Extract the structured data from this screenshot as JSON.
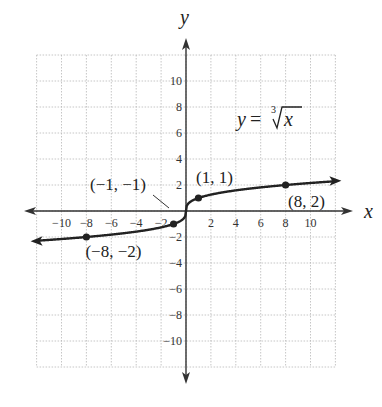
{
  "chart_data": {
    "type": "line",
    "title": "",
    "equation": {
      "lhs": "y",
      "eq": "=",
      "index": "3",
      "radicand": "x",
      "display": "y = ∛x"
    },
    "xlabel": "x",
    "ylabel": "y",
    "xlim": [
      -12,
      12
    ],
    "ylim": [
      -12,
      12
    ],
    "grid": true,
    "grid_style": "dotted",
    "x_ticks": [
      -10,
      -8,
      -6,
      -4,
      -2,
      2,
      4,
      6,
      8,
      10
    ],
    "y_ticks": [
      -10,
      -8,
      -6,
      -4,
      -2,
      2,
      4,
      6,
      8,
      10
    ],
    "x_tick_labels": [
      "−10",
      "−8",
      "−6",
      "−4",
      "−2",
      "2",
      "4",
      "6",
      "8",
      "10"
    ],
    "y_tick_labels": [
      "−10",
      "−8",
      "−6",
      "−4",
      "−2",
      "2",
      "4",
      "6",
      "8",
      "10"
    ],
    "series": [
      {
        "name": "y = ∛x",
        "function": "cbrt",
        "x_range": [
          -12,
          12
        ],
        "color": "#222222"
      }
    ],
    "points": [
      {
        "x": -8,
        "y": -2,
        "label": "(−8, −2)"
      },
      {
        "x": -1,
        "y": -1,
        "label": "(−1, −1)"
      },
      {
        "x": 1,
        "y": 1,
        "label": "(1, 1)"
      },
      {
        "x": 8,
        "y": 2,
        "label": "(8, 2)"
      }
    ]
  },
  "colors": {
    "curve": "#222222",
    "axis": "#333333",
    "grid": "#b8b8b8"
  }
}
